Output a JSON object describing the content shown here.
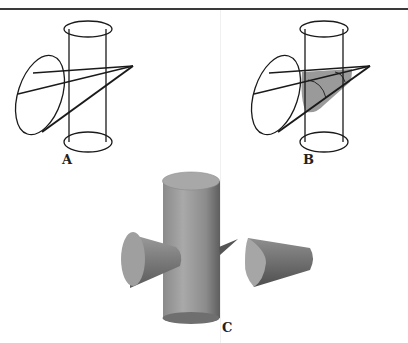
{
  "figure": {
    "panels": [
      {
        "id": "A",
        "label": "A",
        "description": "Wireframe cylinder (vertical) intersected by a wireframe cone (horizontal)"
      },
      {
        "id": "B",
        "label": "B",
        "description": "Same wireframe cylinder and cone with the intersection region shaded gray"
      },
      {
        "id": "C",
        "label": "C",
        "description": "Shaded solid rendering: cylinder with cone passing through, with the cone tip piece separated to the right"
      }
    ]
  },
  "colors": {
    "stroke": "#1a1a1a",
    "shade": "#9a9a9a",
    "solid_light": "#b5b5b5",
    "solid_dark": "#6e6e6e",
    "rule": "#3a3a3a"
  }
}
